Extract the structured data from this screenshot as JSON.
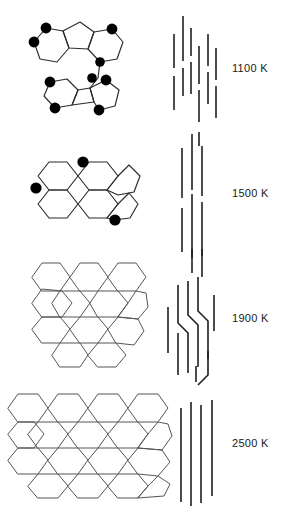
{
  "figure": {
    "background_color": "#ffffff",
    "bond_color": "#2b2b2b",
    "atom_color": "#000000",
    "layer_line_color": "#1f1f1f",
    "label_color": "#1a1a1a"
  },
  "rows": [
    {
      "id": "row-1100",
      "temperature_label": "1100 K",
      "structure_name": "curved-pentagon-containing-cluster",
      "structure_description": "two small fused ring clusters containing five-membered rings, joined by a bridge, with terminal atoms marked as filled circles",
      "marked_atom_count": 10,
      "ring_count": 7,
      "side_view_name": "short-disordered-fringes",
      "side_view_segment_count": 14,
      "side_view_description": "many short staggered vertical fringes of varied length"
    },
    {
      "id": "row-1500",
      "temperature_label": "1500 K",
      "structure_name": "planar-fused-hexagon-cluster",
      "structure_description": "seven fused hexagons forming a flat polycyclic sheet with three filled marker atoms on the rim",
      "marked_atom_count": 3,
      "ring_count": 7,
      "side_view_name": "medium-straight-fringes",
      "side_view_segment_count": 6,
      "side_view_description": "six longer, straighter vertical fringes in two stacked groups"
    },
    {
      "id": "row-1900",
      "temperature_label": "1900 K",
      "structure_name": "hexagonal-lattice-medium",
      "structure_description": "extended honeycomb lattice of about fourteen hexagons with no marker atoms",
      "marked_atom_count": 0,
      "ring_count": 14,
      "side_view_name": "long-kinked-fringes",
      "side_view_segment_count": 9,
      "side_view_description": "long vertical fringes, several showing kinks and steps"
    },
    {
      "id": "row-2500",
      "temperature_label": "2500 K",
      "structure_name": "hexagonal-lattice-large",
      "structure_description": "large graphene-like honeycomb sheet of about twenty-six hexagons",
      "marked_atom_count": 0,
      "ring_count": 26,
      "side_view_name": "long-parallel-fringes",
      "side_view_segment_count": 4,
      "side_view_description": "four long, straight, parallel vertical fringes"
    }
  ]
}
